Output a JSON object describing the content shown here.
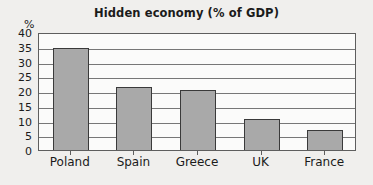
{
  "chart_data": {
    "type": "bar",
    "title": "Hidden economy (% of GDP)",
    "xlabel": "",
    "ylabel": "%",
    "categories": [
      "Poland",
      "Spain",
      "Greece",
      "UK",
      "France"
    ],
    "values": [
      34.5,
      21.5,
      20.3,
      10.5,
      6.7
    ],
    "ylim": [
      0,
      40
    ],
    "yticks": [
      0,
      5,
      10,
      15,
      20,
      25,
      30,
      35,
      40
    ],
    "ytick_labels": [
      "0",
      "5",
      "10",
      "15",
      "20",
      "25",
      "30",
      "35",
      "40"
    ],
    "grid": true,
    "legend": false,
    "bar_color": "#a9a9a9",
    "bar_edge_color": "#3a3a3a",
    "plot_background": "#fbfbfa",
    "figure_background": "#f0efed",
    "axis_color": "#5e5e5e",
    "gridline_color": "#777777",
    "text_color": "#1b1b1b"
  }
}
